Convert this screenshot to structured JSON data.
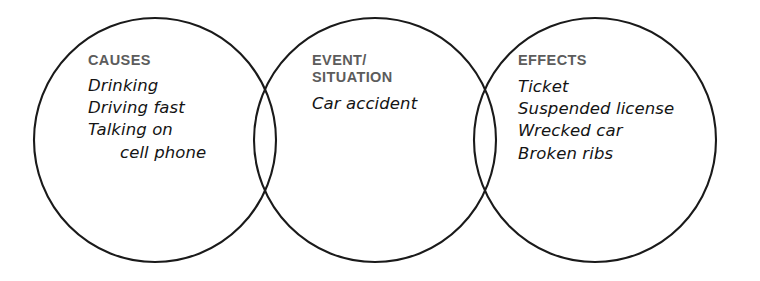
{
  "diagram": {
    "type": "venn-three-circle",
    "background_color": "#ffffff",
    "stroke_color": "#1a1a1a",
    "heading_color": "#5c5c5c",
    "body_color": "#141414",
    "circles": [
      {
        "id": "causes",
        "cx": 155,
        "cy": 140,
        "rx": 121,
        "ry": 122
      },
      {
        "id": "event",
        "cx": 375,
        "cy": 140,
        "rx": 121,
        "ry": 122
      },
      {
        "id": "effects",
        "cx": 595,
        "cy": 140,
        "rx": 121,
        "ry": 122
      }
    ],
    "regions": [
      {
        "id": "causes",
        "heading": "CAUSES",
        "items": [
          {
            "text": "Drinking",
            "continuation": false
          },
          {
            "text": "Driving fast",
            "continuation": false
          },
          {
            "text": "Talking on",
            "continuation": false
          },
          {
            "text": "cell phone",
            "continuation": true
          }
        ]
      },
      {
        "id": "event",
        "heading": "EVENT/\nSITUATION",
        "items": [
          {
            "text": "Car accident",
            "continuation": false
          }
        ]
      },
      {
        "id": "effects",
        "heading": "EFFECTS",
        "items": [
          {
            "text": "Ticket",
            "continuation": false
          },
          {
            "text": "Suspended license",
            "continuation": false
          },
          {
            "text": "Wrecked car",
            "continuation": false
          },
          {
            "text": "Broken ribs",
            "continuation": false
          }
        ]
      }
    ]
  }
}
